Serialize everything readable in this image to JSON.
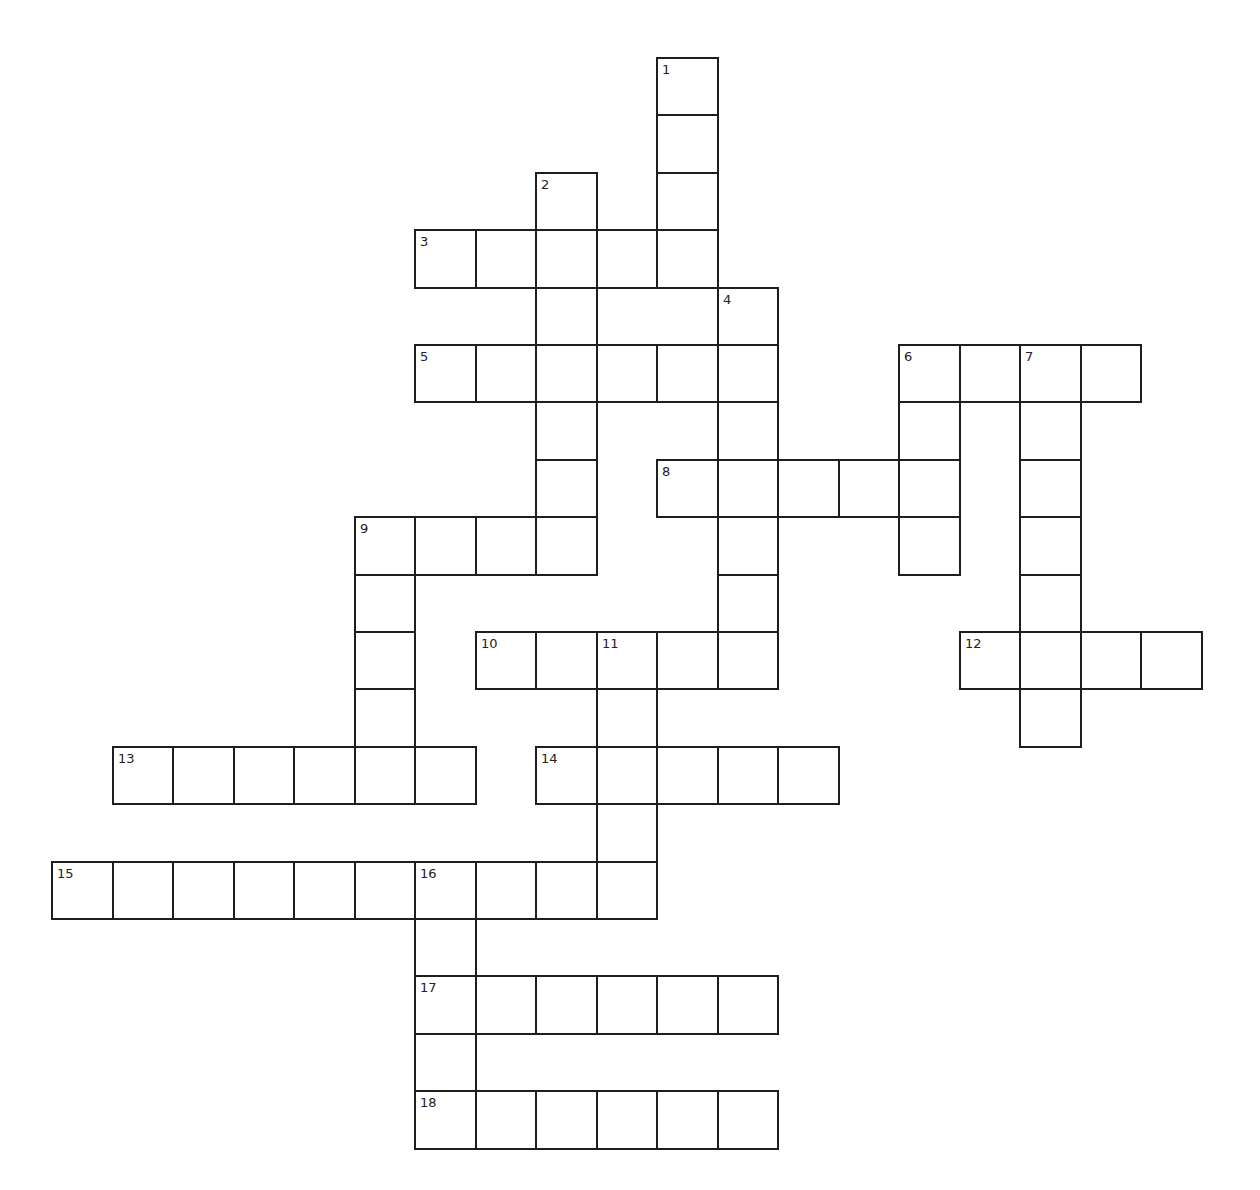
{
  "puzzle": {
    "origin": {
      "x": 51,
      "y": 57
    },
    "cell_w": 60.5,
    "cell_h": 57.4,
    "line_color": "#1e1e1e",
    "background": "#ffffff",
    "entries": [
      {
        "number": "1",
        "direction": "down",
        "col": 10,
        "row": 0,
        "length": 4
      },
      {
        "number": "2",
        "direction": "down",
        "col": 8,
        "row": 2,
        "length": 7
      },
      {
        "number": "3",
        "direction": "across",
        "col": 6,
        "row": 3,
        "length": 5
      },
      {
        "number": "4",
        "direction": "down",
        "col": 11,
        "row": 4,
        "length": 7
      },
      {
        "number": "5",
        "direction": "across",
        "col": 6,
        "row": 5,
        "length": 6
      },
      {
        "number": "6",
        "direction": "across",
        "col": 14,
        "row": 5,
        "length": 4
      },
      {
        "number": "6",
        "direction": "down",
        "col": 14,
        "row": 5,
        "length": 4
      },
      {
        "number": "7",
        "direction": "down",
        "col": 16,
        "row": 5,
        "length": 7
      },
      {
        "number": "8",
        "direction": "across",
        "col": 10,
        "row": 7,
        "length": 5
      },
      {
        "number": "9",
        "direction": "across",
        "col": 5,
        "row": 8,
        "length": 4
      },
      {
        "number": "9",
        "direction": "down",
        "col": 5,
        "row": 8,
        "length": 5
      },
      {
        "number": "10",
        "direction": "across",
        "col": 7,
        "row": 10,
        "length": 5
      },
      {
        "number": "11",
        "direction": "down",
        "col": 9,
        "row": 10,
        "length": 5
      },
      {
        "number": "12",
        "direction": "across",
        "col": 15,
        "row": 10,
        "length": 4
      },
      {
        "number": "13",
        "direction": "across",
        "col": 1,
        "row": 12,
        "length": 6
      },
      {
        "number": "14",
        "direction": "across",
        "col": 8,
        "row": 12,
        "length": 5
      },
      {
        "number": "15",
        "direction": "across",
        "col": 0,
        "row": 14,
        "length": 10
      },
      {
        "number": "16",
        "direction": "down",
        "col": 6,
        "row": 14,
        "length": 5
      },
      {
        "number": "17",
        "direction": "across",
        "col": 6,
        "row": 16,
        "length": 6
      },
      {
        "number": "18",
        "direction": "across",
        "col": 6,
        "row": 18,
        "length": 6
      }
    ]
  }
}
